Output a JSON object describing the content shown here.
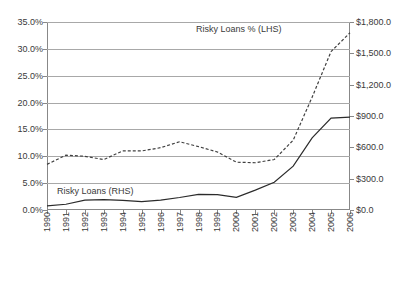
{
  "chart_data": {
    "type": "line",
    "title": "",
    "xlabel": "",
    "x": [
      1990,
      1991,
      1992,
      1993,
      1994,
      1995,
      1996,
      1997,
      1998,
      1999,
      2000,
      2001,
      2002,
      2003,
      2004,
      2005,
      2006
    ],
    "axes": {
      "left": {
        "label": "Risky Loans % (LHS)",
        "ylim": [
          0,
          35
        ],
        "ticks": [
          0,
          5,
          10,
          15,
          20,
          25,
          30,
          35
        ],
        "ticklabels": [
          "0.0%",
          "5.0%",
          "10.0%",
          "15.0%",
          "20.0%",
          "25.0%",
          "30.0%",
          "35.0%"
        ]
      },
      "right": {
        "label": "Risky Loans (RHS)",
        "ylim": [
          0,
          1800
        ],
        "ticks": [
          0,
          300,
          600,
          900,
          1200,
          1500,
          1800
        ],
        "ticklabels": [
          "$0.0",
          "$300.0",
          "$600.0",
          "$900.0",
          "$1,200.0",
          "$1,500.0",
          "$1,800.0"
        ]
      }
    },
    "grid": true,
    "legend_position": "inline-annotations",
    "series": [
      {
        "name": "Risky Loans % (LHS)",
        "axis": "left",
        "style": "dashed",
        "color": "#404040",
        "values": [
          8.5,
          10.2,
          10.0,
          9.4,
          11.0,
          11.0,
          11.6,
          12.7,
          11.8,
          10.8,
          8.9,
          8.8,
          9.4,
          13.0,
          21.0,
          29.5,
          33.0
        ]
      },
      {
        "name": "Risky Loans (RHS)",
        "axis": "right",
        "style": "solid",
        "color": "#2b2b2b",
        "values": [
          40,
          55,
          95,
          100,
          92,
          80,
          95,
          120,
          150,
          148,
          122,
          190,
          265,
          420,
          690,
          880,
          890
        ]
      }
    ],
    "xticklabels": [
      "1990",
      "1991",
      "1992",
      "1993",
      "1994",
      "1995",
      "1996",
      "1997",
      "1998",
      "1999",
      "2000",
      "2001",
      "2002",
      "2003",
      "2004",
      "2005",
      "2006"
    ]
  },
  "annotations": {
    "lhs_label": "Risky Loans % (LHS)",
    "rhs_label": "Risky Loans (RHS)"
  },
  "colors": {
    "axis": "#888888",
    "grid": "#a8a8a8",
    "text": "#3a3a3a",
    "dashed_series": "#404040",
    "solid_series": "#2b2b2b",
    "background": "#ffffff"
  }
}
